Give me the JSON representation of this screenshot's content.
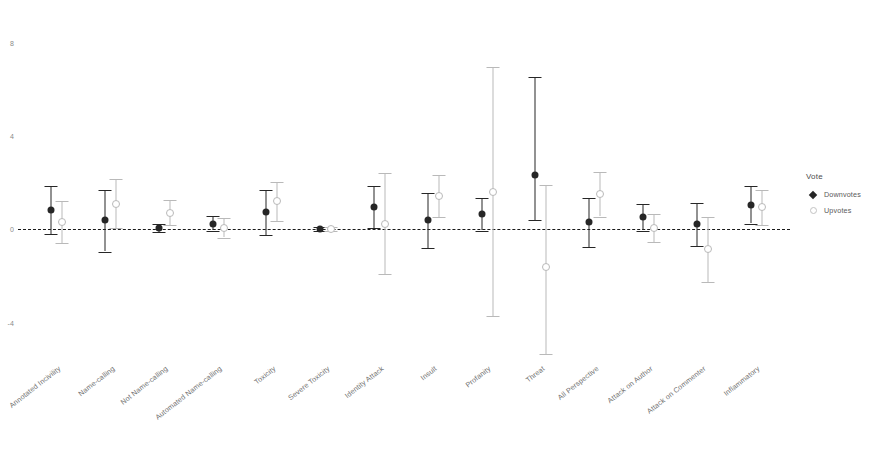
{
  "chart_data": {
    "type": "scatter",
    "title": "",
    "xlabel": "",
    "ylabel": "",
    "ylim": [
      -5.6,
      9.4
    ],
    "yticks": [
      8,
      4,
      0,
      -4
    ],
    "ytick_labels": [
      "8",
      "4",
      "0",
      "-4"
    ],
    "grid": false,
    "zero_reference_line": 0,
    "legend": {
      "position": "right",
      "title": "Vote",
      "entries": [
        {
          "name": "Downvotes",
          "marker": "filled-diamond",
          "color": "#262626"
        },
        {
          "name": "Upvotes",
          "marker": "open-circle",
          "color": "#b9b9b9"
        }
      ]
    },
    "categories": [
      "Annotated Incivility",
      "Name-calling",
      "Not Name-calling",
      "Automated Name-calling",
      "Toxicity",
      "Severe Toxicity",
      "Identity Attack",
      "Insult",
      "Profanity",
      "Threat",
      "All Perspective",
      "Attack on Author",
      "Attack on Commenter",
      "Inflammatory"
    ],
    "series": [
      {
        "name": "Downvotes",
        "color": "#262626",
        "values": [
          0.85,
          0.42,
          0.05,
          0.25,
          0.75,
          0.02,
          0.95,
          0.38,
          0.65,
          2.35,
          0.3,
          0.55,
          0.22,
          1.05
        ],
        "ci_low": [
          -0.2,
          -0.95,
          -0.1,
          -0.05,
          -0.25,
          -0.05,
          0.05,
          -0.8,
          -0.05,
          0.38,
          -0.75,
          -0.05,
          -0.7,
          0.25
        ],
        "ci_high": [
          1.85,
          1.7,
          0.22,
          0.58,
          1.7,
          0.1,
          1.85,
          1.55,
          1.35,
          6.55,
          1.35,
          1.1,
          1.15,
          1.85
        ]
      },
      {
        "name": "Upvotes",
        "color": "#b9b9b9",
        "values": [
          0.3,
          1.1,
          0.72,
          0.05,
          1.2,
          0.01,
          0.25,
          1.45,
          1.6,
          -1.6,
          1.5,
          0.05,
          -0.85,
          0.95
        ],
        "ci_low": [
          -0.6,
          0.05,
          0.18,
          -0.35,
          0.35,
          -0.06,
          -1.9,
          0.55,
          -3.7,
          -5.35,
          0.55,
          -0.55,
          -2.25,
          0.2
        ],
        "ci_high": [
          1.22,
          2.15,
          1.25,
          0.48,
          2.05,
          0.08,
          2.4,
          2.35,
          6.95,
          1.9,
          2.45,
          0.65,
          0.55,
          1.7
        ]
      }
    ]
  }
}
